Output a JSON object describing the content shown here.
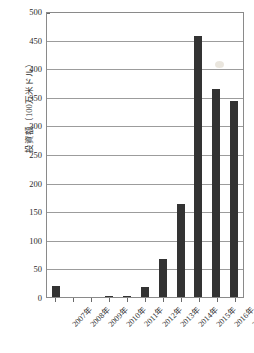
{
  "chart_data": {
    "type": "bar",
    "title": "",
    "xlabel": "",
    "ylabel": "投資額（100万米ドル）",
    "ylim": [
      0,
      500
    ],
    "ytick_step": 50,
    "grid": true,
    "legend": "none",
    "bar_color": "#333333",
    "categories": [
      "2007年",
      "2008年",
      "2009年",
      "2010年",
      "2011年",
      "2012年",
      "2013年",
      "2014年",
      "2015年",
      "2016年",
      "2017年"
    ],
    "values": [
      20,
      0.5,
      0.3,
      1.5,
      2.5,
      18,
      66,
      162,
      457,
      363,
      343
    ],
    "ytick_labels": [
      "500",
      "450",
      "400",
      "350",
      "300",
      "250",
      "200",
      "150",
      "100",
      "50",
      "0"
    ],
    "ytick_values": [
      500,
      450,
      400,
      350,
      300,
      250,
      200,
      150,
      100,
      50,
      0
    ]
  }
}
